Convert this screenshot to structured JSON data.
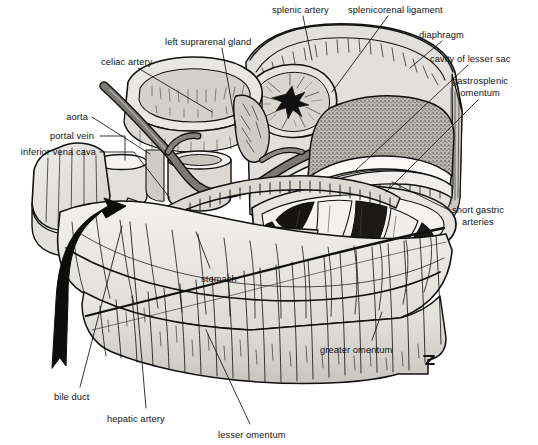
{
  "figure": {
    "style": "black-and-white pen-and-ink anatomical illustration",
    "signature": "artist monogram (lower right of omentum)"
  },
  "colors": {
    "background": "#ffffff",
    "ink": "#111111",
    "light_tissue": "#e8e7e4",
    "mid_tissue": "#cfccc7",
    "dark_tissue": "#8e8a85",
    "vessel_grey": "#7d7a76",
    "lumen_white": "#f7f6f4",
    "spleen_stipple": "#9b9893",
    "pancreas": "#dcd9d4"
  },
  "labels": [
    {
      "id": "splenic-artery",
      "text": "splenic artery",
      "x": 272,
      "y": 5,
      "align": "left",
      "lines": [
        "splenic artery"
      ]
    },
    {
      "id": "splenicorenal-ligament",
      "text": "splenicorenal ligament",
      "x": 348,
      "y": 5,
      "align": "left",
      "lines": [
        "splenicorenal ligament"
      ]
    },
    {
      "id": "left-suprarenal-gland",
      "text": "left suprarenal gland",
      "x": 165,
      "y": 37,
      "align": "left",
      "lines": [
        "left suprarenal gland"
      ]
    },
    {
      "id": "diaphragm",
      "text": "diaphragm",
      "x": 419,
      "y": 30,
      "align": "left",
      "lines": [
        "diaphragm"
      ]
    },
    {
      "id": "celiac-artery",
      "text": "celiac artery",
      "x": 101,
      "y": 57,
      "align": "left",
      "lines": [
        "celiac artery"
      ]
    },
    {
      "id": "cavity-of-lesser-sac",
      "text": "cavity of lesser sac",
      "x": 430,
      "y": 54,
      "align": "left",
      "lines": [
        "cavity of lesser sac"
      ]
    },
    {
      "id": "gastrosplenic-omentum",
      "text": "gastrosplenic omentum",
      "x": 452,
      "y": 76,
      "align": "left",
      "lines": [
        "gastrosplenic",
        "omentum"
      ]
    },
    {
      "id": "aorta",
      "text": "aorta",
      "x": 88,
      "y": 112,
      "align": "right",
      "lines": [
        "aorta"
      ]
    },
    {
      "id": "portal-vein",
      "text": "portal vein",
      "x": 94,
      "y": 131,
      "align": "right",
      "lines": [
        "portal vein"
      ]
    },
    {
      "id": "inferior-vena-cava",
      "text": "inferior vena cava",
      "x": 96,
      "y": 147,
      "align": "right",
      "lines": [
        "inferior vena cava"
      ]
    },
    {
      "id": "short-gastric-arteries",
      "text": "short gastric arteries",
      "x": 452,
      "y": 205,
      "align": "left",
      "lines": [
        "short gastric",
        "arteries"
      ]
    },
    {
      "id": "stomach",
      "text": "stomach",
      "x": 201,
      "y": 274,
      "align": "left",
      "lines": [
        "stomach"
      ]
    },
    {
      "id": "greater-omentum",
      "text": "greater omentum",
      "x": 320,
      "y": 345,
      "align": "left",
      "lines": [
        "greater omentum"
      ]
    },
    {
      "id": "bile-duct",
      "text": "bile duct",
      "x": 54,
      "y": 392,
      "align": "left",
      "lines": [
        "bile duct"
      ]
    },
    {
      "id": "hepatic-artery",
      "text": "hepatic artery",
      "x": 107,
      "y": 414,
      "align": "left",
      "lines": [
        "hepatic artery"
      ]
    },
    {
      "id": "lesser-omentum",
      "text": "lesser omentum",
      "x": 218,
      "y": 430,
      "align": "left",
      "lines": [
        "lesser omentum"
      ]
    }
  ],
  "structures": [
    {
      "id": "liver",
      "name": "liver (reflected, left lobe)"
    },
    {
      "id": "stomach-body",
      "name": "stomach anterior wall"
    },
    {
      "id": "greater-omentum",
      "name": "greater omentum apron"
    },
    {
      "id": "lesser-omentum",
      "name": "lesser omentum"
    },
    {
      "id": "spleen",
      "name": "spleen (sectioned)"
    },
    {
      "id": "left-kidney",
      "name": "left kidney (sectioned)"
    },
    {
      "id": "suprarenal-gland",
      "name": "left suprarenal gland"
    },
    {
      "id": "diaphragm",
      "name": "diaphragm (cut edge)"
    },
    {
      "id": "lesser-sac",
      "name": "cavity of the lesser sac"
    },
    {
      "id": "pancreas",
      "name": "pancreas"
    },
    {
      "id": "aorta",
      "name": "abdominal aorta"
    },
    {
      "id": "ivc",
      "name": "inferior vena cava"
    },
    {
      "id": "portal-vein",
      "name": "portal vein"
    },
    {
      "id": "celiac-trunk",
      "name": "celiac artery"
    },
    {
      "id": "splenic-artery",
      "name": "splenic artery"
    },
    {
      "id": "hepatic-artery",
      "name": "hepatic artery"
    },
    {
      "id": "bile-duct",
      "name": "bile duct"
    },
    {
      "id": "epiploic-arrow",
      "name": "curved arrow through epiploic foramen"
    }
  ]
}
